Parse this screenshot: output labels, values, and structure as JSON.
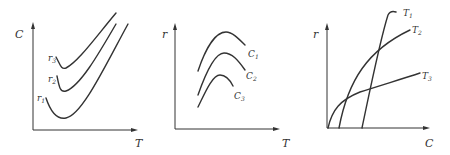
{
  "panels": [
    {
      "id": "panel-1",
      "y_label": "C",
      "x_label": "T",
      "curves": [
        {
          "label": "r",
          "sub": "3"
        },
        {
          "label": "r",
          "sub": "2"
        },
        {
          "label": "r",
          "sub": "1"
        }
      ]
    },
    {
      "id": "panel-2",
      "y_label": "r",
      "x_label": "T",
      "curves": [
        {
          "label": "C",
          "sub": "1"
        },
        {
          "label": "C",
          "sub": "2"
        },
        {
          "label": "C",
          "sub": "3"
        }
      ]
    },
    {
      "id": "panel-3",
      "y_label": "r",
      "x_label": "C",
      "curves": [
        {
          "label": "T",
          "sub": "1"
        },
        {
          "label": "T",
          "sub": "2"
        },
        {
          "label": "T",
          "sub": "3"
        }
      ]
    }
  ],
  "colors": {
    "line": "#333333",
    "background": "#ffffff"
  }
}
